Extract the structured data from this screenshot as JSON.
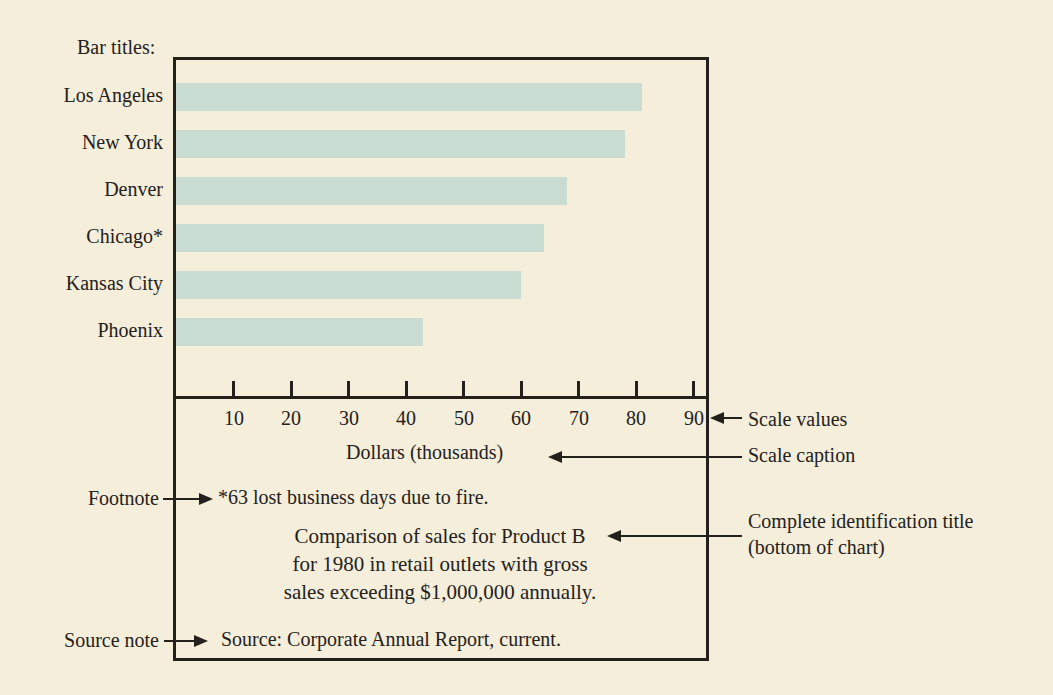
{
  "palette": {
    "background": "#f4eeda",
    "bar_fill": "#c9dcd1",
    "ink": "#24211c"
  },
  "annotations": {
    "bar_titles": "Bar titles:",
    "scale_values": "Scale values",
    "scale_caption": "Scale caption",
    "footnote": "Footnote",
    "identification_title_line1": "Complete identification title",
    "identification_title_line2": "(bottom of chart)",
    "source_note": "Source note"
  },
  "chart_data": {
    "type": "bar",
    "orientation": "horizontal",
    "categories": [
      "Los Angeles",
      "New York",
      "Denver",
      "Chicago*",
      "Kansas City",
      "Phoenix"
    ],
    "values": [
      81,
      78,
      68,
      64,
      60,
      43
    ],
    "xlabel": "Dollars (thousands)",
    "xticks": [
      10,
      20,
      30,
      40,
      50,
      60,
      70,
      80,
      90
    ],
    "xlim": [
      0,
      93
    ],
    "grid": false,
    "legend": "none",
    "title_lines": [
      "Comparison of sales for Product B",
      "for 1980 in retail outlets with gross",
      "sales exceeding $1,000,000 annually."
    ],
    "footnote": "*63 lost business days due to fire.",
    "source": "Source: Corporate Annual Report, current."
  }
}
